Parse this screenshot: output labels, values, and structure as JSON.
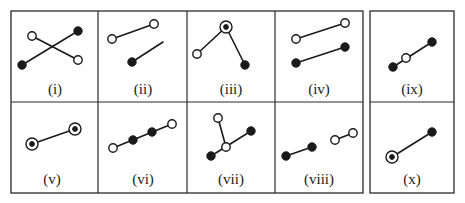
{
  "figure": {
    "panels": [
      {
        "id": "i",
        "label": "(i)"
      },
      {
        "id": "ii",
        "label": "(ii)"
      },
      {
        "id": "iii",
        "label": "(iii)"
      },
      {
        "id": "iv",
        "label": "(iv)"
      },
      {
        "id": "v",
        "label": "(v)"
      },
      {
        "id": "vi",
        "label": "(vi)"
      },
      {
        "id": "vii",
        "label": "(vii)"
      },
      {
        "id": "viii",
        "label": "(viii)"
      },
      {
        "id": "ix",
        "label": "(ix)"
      },
      {
        "id": "x",
        "label": "(x)"
      }
    ],
    "legend_of_node_types": {
      "open": "open circle",
      "filled": "filled circle",
      "ringed": "circle with dot (bullseye)"
    },
    "colors": {
      "stroke": "#1a1a1a",
      "border": "#2a2a2a",
      "background": "#ffffff"
    }
  }
}
